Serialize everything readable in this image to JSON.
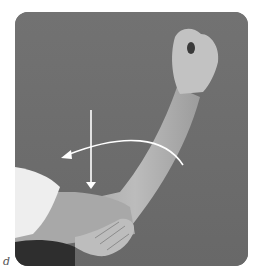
{
  "figure": {
    "panel_label": "d",
    "colors": {
      "background": "#6e6e6e",
      "skin": "#b8b8b8",
      "skin_shadow": "#9a9a9a",
      "shirt": "#eeeeee",
      "arrow": "#ffffff"
    },
    "arrows": [
      {
        "name": "vertical-down-arrow",
        "direction": "down"
      },
      {
        "name": "curved-arc-arrow",
        "direction": "right-to-left"
      }
    ]
  }
}
